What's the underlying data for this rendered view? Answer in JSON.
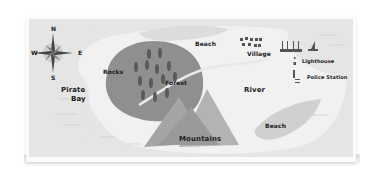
{
  "map": {
    "colors": {
      "sea": "#e5e5e5",
      "land": "#f1f1f1",
      "beach": "#d7d7d7",
      "forest": "#8f8f8f",
      "trees": "#5a5a5a",
      "mountains": "#a5a5a5",
      "text": "#222222"
    },
    "compass": {
      "north": "N",
      "south": "S",
      "east": "E",
      "west": "W"
    },
    "labels": {
      "rocks": "Rocks",
      "forest": "Forest",
      "beach_north": "Beach",
      "village": "Village",
      "lighthouse": "Lighthouse",
      "police_station": "Police Station",
      "river": "River",
      "pirate_bay_line1": "Pirate",
      "pirate_bay_line2": "Bay",
      "mountains": "Mountains",
      "beach_south": "Beach"
    }
  }
}
